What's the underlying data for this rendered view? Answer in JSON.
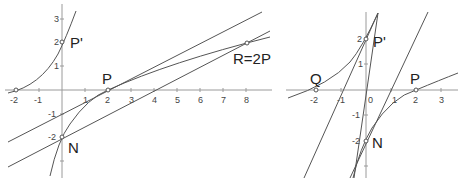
{
  "left_plot": {
    "x_ticks": [
      "-2",
      "-1",
      "1",
      "2",
      "3",
      "4",
      "5",
      "6",
      "7",
      "8"
    ],
    "y_ticks": [
      "3",
      "2",
      "1",
      "-1",
      "-2"
    ],
    "points": {
      "p_prime": "P'",
      "p": "P",
      "n": "N",
      "r": "R=2P"
    }
  },
  "right_plot": {
    "x_ticks": [
      "-2",
      "-1",
      "0",
      "1",
      "2",
      "3"
    ],
    "y_ticks": [
      "2",
      "1",
      "-1",
      "-2"
    ],
    "points": {
      "p_prime": "P'",
      "p": "P",
      "n": "N",
      "q": "Q"
    }
  }
}
